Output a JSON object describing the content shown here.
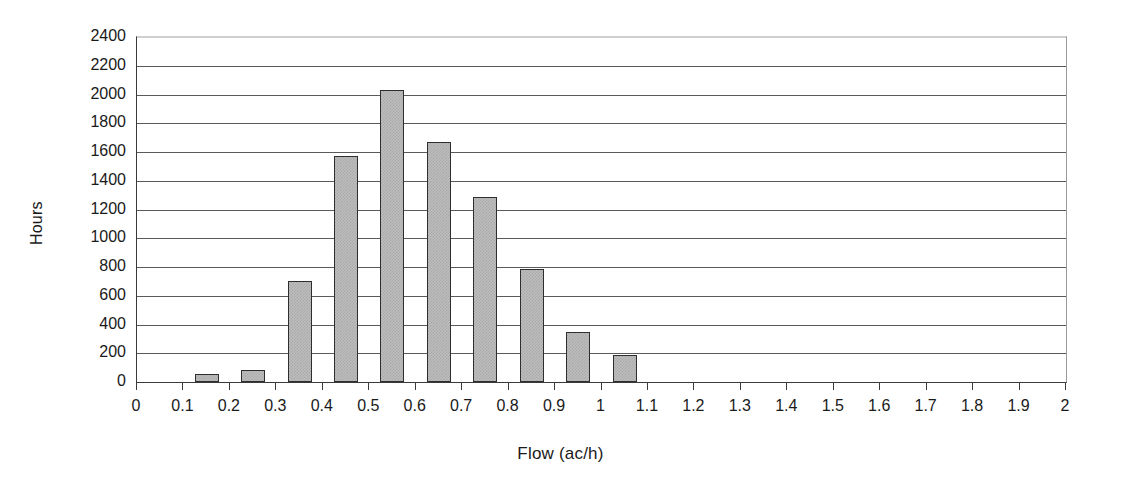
{
  "chart_data": {
    "type": "bar",
    "title": "",
    "subtitle": "",
    "xlabel": "Flow (ac/h)",
    "ylabel": "Hours",
    "categories": [
      "0",
      "0.1",
      "0.2",
      "0.3",
      "0.4",
      "0.5",
      "0.6",
      "0.7",
      "0.8",
      "0.9",
      "1",
      "1.1",
      "1.2",
      "1.3",
      "1.4",
      "1.5",
      "1.6",
      "1.7",
      "1.8",
      "1.9",
      "2"
    ],
    "values": [
      0,
      55,
      85,
      705,
      1570,
      2030,
      1670,
      1285,
      785,
      345,
      190,
      0,
      0,
      0,
      0,
      0,
      0,
      0,
      0,
      0,
      0
    ],
    "bar_centers": [
      "0.05",
      "0.15",
      "0.25",
      "0.35",
      "0.45",
      "0.55",
      "0.65",
      "0.75",
      "0.85",
      "0.95",
      "1.05",
      "1.15",
      "1.25",
      "1.35",
      "1.45",
      "1.55",
      "1.65",
      "1.75",
      "1.85",
      "1.95"
    ],
    "xlim": [
      0,
      2
    ],
    "ylim": [
      0,
      2400
    ],
    "y_ticks": [
      0,
      200,
      400,
      600,
      800,
      1000,
      1200,
      1400,
      1600,
      1800,
      2000,
      2200,
      2400
    ],
    "y_tick_labels": [
      "0",
      "200",
      "400",
      "600",
      "800",
      "1000",
      "1200",
      "1400",
      "1600",
      "1800",
      "2000",
      "2200",
      "2400"
    ],
    "x_ticks": [
      0,
      0.1,
      0.2,
      0.3,
      0.4,
      0.5,
      0.6,
      0.7,
      0.8,
      0.9,
      1.0,
      1.1,
      1.2,
      1.3,
      1.4,
      1.5,
      1.6,
      1.7,
      1.8,
      1.9,
      2.0
    ],
    "x_tick_labels": [
      "0",
      "0.1",
      "0.2",
      "0.3",
      "0.4",
      "0.5",
      "0.6",
      "0.7",
      "0.8",
      "0.9",
      "1",
      "1.1",
      "1.2",
      "1.3",
      "1.4",
      "1.5",
      "1.6",
      "1.7",
      "1.8",
      "1.9",
      "2"
    ],
    "grid": {
      "horizontal": true,
      "vertical": false
    },
    "legend": {
      "visible": false,
      "position": "none"
    },
    "colors": {
      "bar_fill": "#bdbdbd",
      "bar_pattern": "#a9a9a9",
      "bar_border": "#2e2e2e",
      "gridline": "#5a5a5a",
      "axis": "#3a3a3a",
      "background": "#ffffff",
      "text": "#1a1a1a"
    }
  }
}
